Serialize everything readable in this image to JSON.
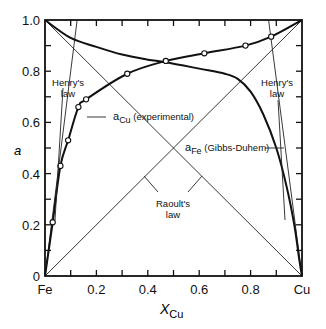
{
  "chart_data": {
    "type": "line",
    "title": "",
    "xlabel": "X_Cu",
    "xlabel_main": "X",
    "xlabel_sub": "Cu",
    "ylabel": "a",
    "xlim": [
      0,
      1
    ],
    "ylim": [
      0,
      1
    ],
    "x_tick_labels": [
      "Fe",
      "0.2",
      "0.4",
      "0.6",
      "0.8",
      "Cu"
    ],
    "x_tick_values": [
      0,
      0.2,
      0.4,
      0.6,
      0.8,
      1.0
    ],
    "y_tick_labels": [
      "0",
      "0.2",
      "0.4",
      "0.6",
      "0.8",
      "1.0"
    ],
    "y_tick_values": [
      0,
      0.2,
      0.4,
      0.6,
      0.8,
      1.0
    ],
    "grid": false,
    "series": [
      {
        "name": "a_Cu (experimental)",
        "style": "thick line with open circle markers",
        "points": [
          [
            0.03,
            0.21
          ],
          [
            0.06,
            0.43
          ],
          [
            0.09,
            0.53
          ],
          [
            0.13,
            0.66
          ],
          [
            0.16,
            0.69
          ],
          [
            0.32,
            0.79
          ],
          [
            0.47,
            0.84
          ],
          [
            0.62,
            0.87
          ],
          [
            0.78,
            0.9
          ],
          [
            0.88,
            0.935
          ],
          [
            1.0,
            1.0
          ]
        ]
      },
      {
        "name": "a_Fe (Gibbs-Duhem)",
        "style": "thick line",
        "points": [
          [
            0,
            1.0
          ],
          [
            0.1,
            0.93
          ],
          [
            0.2,
            0.895
          ],
          [
            0.3,
            0.865
          ],
          [
            0.4,
            0.845
          ],
          [
            0.47,
            0.835
          ],
          [
            0.6,
            0.81
          ],
          [
            0.7,
            0.79
          ],
          [
            0.75,
            0.77
          ],
          [
            0.8,
            0.72
          ],
          [
            0.85,
            0.63
          ],
          [
            0.9,
            0.5
          ],
          [
            0.94,
            0.35
          ],
          [
            0.97,
            0.2
          ],
          [
            0.99,
            0.06
          ],
          [
            1.0,
            0.0
          ]
        ]
      },
      {
        "name": "Raoult's law (Cu)",
        "style": "thin line",
        "points": [
          [
            0,
            0
          ],
          [
            1,
            1
          ]
        ]
      },
      {
        "name": "Raoult's law (Fe)",
        "style": "thin line",
        "points": [
          [
            0,
            1
          ],
          [
            1,
            0
          ]
        ]
      },
      {
        "name": "Henry's law (Cu)",
        "style": "thin line",
        "points": [
          [
            0,
            0
          ],
          [
            0.125,
            1.0
          ]
        ]
      },
      {
        "name": "Henry's law (Fe)",
        "style": "thin line",
        "points": [
          [
            1,
            0
          ],
          [
            0.87,
            1.0
          ]
        ]
      }
    ],
    "annotations": [
      {
        "text": "Henry's law",
        "lines": [
          "Henry's",
          "law"
        ],
        "position": "upper left"
      },
      {
        "text": "Henry's law",
        "lines": [
          "Henry's",
          "law"
        ],
        "position": "upper right"
      },
      {
        "text": "a_Cu (experimental)",
        "main": "a",
        "sub": "Cu",
        "rest": " (experimental)"
      },
      {
        "text": "a_Fe (Gibbs-Duhem)",
        "main": "a",
        "sub": "Fe",
        "rest": " (Gibbs-Duhem)"
      },
      {
        "text": "Raoult's law",
        "lines": [
          "Raoult's",
          "law"
        ],
        "position": "center bottom"
      }
    ]
  }
}
